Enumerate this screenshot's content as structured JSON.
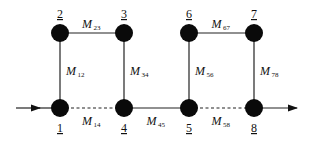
{
  "diagram": {
    "type": "graph",
    "nodes": [
      {
        "id": "1",
        "label": "1",
        "x": 60,
        "y": 108,
        "label_pos": "below"
      },
      {
        "id": "2",
        "label": "2",
        "x": 60,
        "y": 33,
        "label_pos": "above"
      },
      {
        "id": "3",
        "label": "3",
        "x": 124,
        "y": 33,
        "label_pos": "above"
      },
      {
        "id": "4",
        "label": "4",
        "x": 124,
        "y": 108,
        "label_pos": "below"
      },
      {
        "id": "5",
        "label": "5",
        "x": 189,
        "y": 108,
        "label_pos": "below"
      },
      {
        "id": "6",
        "label": "6",
        "x": 189,
        "y": 33,
        "label_pos": "above"
      },
      {
        "id": "7",
        "label": "7",
        "x": 254,
        "y": 33,
        "label_pos": "above"
      },
      {
        "id": "8",
        "label": "8",
        "x": 254,
        "y": 108,
        "label_pos": "below"
      }
    ],
    "edges": [
      {
        "from": "1",
        "to": "2",
        "label": "M",
        "sub": "12",
        "style": "solid"
      },
      {
        "from": "2",
        "to": "3",
        "label": "M",
        "sub": "23",
        "style": "solid"
      },
      {
        "from": "3",
        "to": "4",
        "label": "M",
        "sub": "34",
        "style": "solid"
      },
      {
        "from": "1",
        "to": "4",
        "label": "M",
        "sub": "14",
        "style": "dashed"
      },
      {
        "from": "4",
        "to": "5",
        "label": "M",
        "sub": "45",
        "style": "solid"
      },
      {
        "from": "5",
        "to": "6",
        "label": "M",
        "sub": "56",
        "style": "solid"
      },
      {
        "from": "6",
        "to": "7",
        "label": "M",
        "sub": "67",
        "style": "solid"
      },
      {
        "from": "7",
        "to": "8",
        "label": "M",
        "sub": "78",
        "style": "solid"
      },
      {
        "from": "5",
        "to": "8",
        "label": "M",
        "sub": "58",
        "style": "dashed"
      }
    ],
    "input_arrow": {
      "from_x": 16,
      "to_node": "1"
    },
    "output_arrow": {
      "from_node": "8",
      "to_x": 297
    }
  }
}
